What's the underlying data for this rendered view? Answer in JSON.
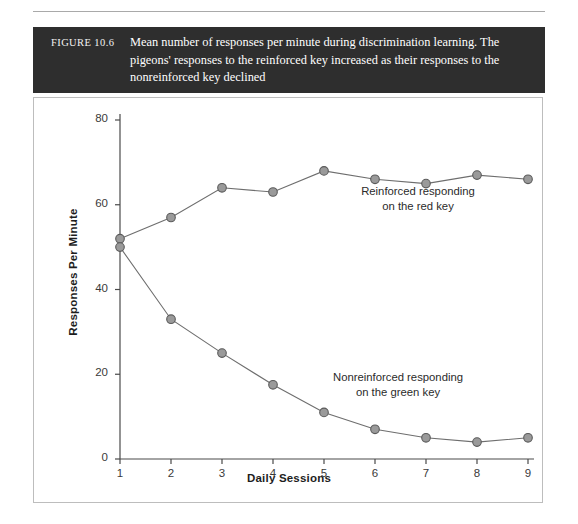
{
  "figure": {
    "label": "FIGURE 10.6",
    "caption": "Mean number of responses per minute during discrimination learning. The pigeons' responses to the reinforced key increased as their responses to the nonreinforced key declined"
  },
  "colors": {
    "caption_bar": "#2e2e2e",
    "caption_text": "#ffffff",
    "marker_fill": "#9a9a9a",
    "marker_stroke": "#5a5a5a",
    "line": "#6e6e6e",
    "axis": "#4a4a4a",
    "plot_border": "#bdbdbd"
  },
  "chart_data": {
    "type": "line",
    "title": "",
    "xlabel": "Daily Sessions",
    "ylabel": "Responses Per Minute",
    "x": [
      1,
      2,
      3,
      4,
      5,
      6,
      7,
      8,
      9
    ],
    "xticklabels": [
      "1",
      "2",
      "3",
      "4",
      "5",
      "6",
      "7",
      "8",
      "9"
    ],
    "yticks": [
      0,
      20,
      40,
      60,
      80
    ],
    "yticklabels": [
      "0",
      "20",
      "40",
      "60",
      "80"
    ],
    "xlim": [
      1,
      9
    ],
    "ylim": [
      0,
      80
    ],
    "grid": false,
    "legend": "none",
    "series": [
      {
        "name": "Reinforced responding on the red key",
        "values": [
          52,
          57,
          64,
          63,
          68,
          66,
          65,
          67,
          66
        ]
      },
      {
        "name": "Nonreinforced responding on the green key",
        "values": [
          50,
          33,
          25,
          17.5,
          11,
          7,
          5,
          4,
          5
        ]
      }
    ],
    "annotations": [
      {
        "id": "upper",
        "line1": "Reinforced responding",
        "line2": "on the red key"
      },
      {
        "id": "lower",
        "line1": "Nonreinforced responding",
        "line2": "on the green key"
      }
    ]
  }
}
